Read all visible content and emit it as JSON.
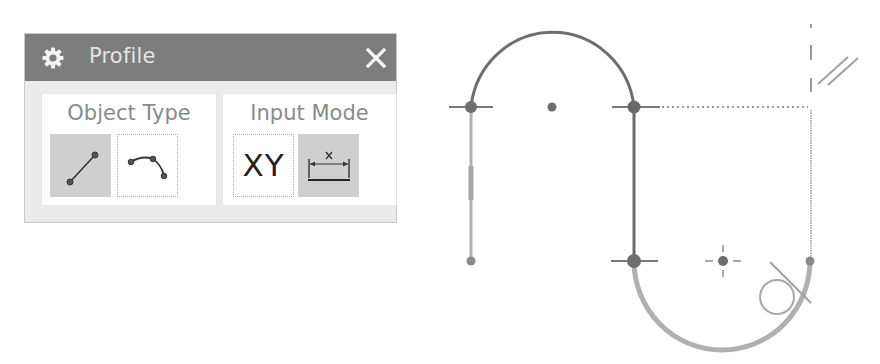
{
  "dialog": {
    "title": "Profile",
    "title_icon": "gear-icon",
    "close_icon": "close-icon",
    "colors": {
      "titlebar": "#7d7d7d",
      "body": "#ebebeb",
      "active_button": "#cfcfcf",
      "label": "#8a8a8a"
    },
    "groups": [
      {
        "label": "Object Type",
        "buttons": [
          {
            "name": "line",
            "icon": "line-icon",
            "active": true
          },
          {
            "name": "arc",
            "icon": "arc-icon",
            "active": false
          }
        ]
      },
      {
        "label": "Input Mode",
        "buttons": [
          {
            "name": "coordinate-mode",
            "label": "XY",
            "active": false
          },
          {
            "name": "parameter-mode",
            "icon": "dimension-icon",
            "active": true
          }
        ]
      }
    ]
  },
  "sketch": {
    "colors": {
      "dark_curve": "#6e6e6e",
      "light_curve": "#b0b0b0",
      "point": "#707070",
      "guide": "#9a9a9a"
    },
    "elements": [
      {
        "type": "arc",
        "name": "top-arc",
        "center": [
          552,
          107
        ],
        "radius": 82
      },
      {
        "type": "line",
        "name": "left-vertical-line",
        "from": [
          471,
          107
        ],
        "to": [
          471,
          261
        ]
      },
      {
        "type": "line",
        "name": "middle-vertical-line",
        "from": [
          634,
          107
        ],
        "to": [
          634,
          261
        ]
      },
      {
        "type": "arc",
        "name": "bottom-arc-preview",
        "center": [
          723,
          261
        ],
        "radius": 88
      },
      {
        "type": "dotted-guide",
        "name": "horizontal-guide",
        "from": [
          660,
          107
        ],
        "to": [
          810,
          107
        ]
      },
      {
        "type": "guide",
        "name": "right-vertical-guide",
        "from": [
          811,
          107
        ],
        "to": [
          811,
          261
        ]
      },
      {
        "type": "dashed-guide",
        "name": "vertical-dashed-guide",
        "from": [
          811,
          24
        ],
        "to": [
          811,
          92
        ]
      },
      {
        "type": "constraint",
        "name": "parallel-symbol",
        "position": [
          838,
          70
        ]
      },
      {
        "type": "constraint",
        "name": "tangent-symbol",
        "position": [
          777,
          297
        ]
      }
    ],
    "points": [
      {
        "name": "left-top-endpoint",
        "position": [
          471,
          107
        ]
      },
      {
        "name": "top-arc-center",
        "position": [
          552,
          107
        ]
      },
      {
        "name": "right-top-endpoint",
        "position": [
          634,
          107
        ]
      },
      {
        "name": "left-bottom-endpoint",
        "position": [
          471,
          261
        ]
      },
      {
        "name": "middle-bottom-endpoint",
        "position": [
          634,
          261
        ]
      },
      {
        "name": "bottom-arc-center",
        "position": [
          723,
          261
        ]
      },
      {
        "name": "cursor-endpoint",
        "position": [
          810,
          261
        ]
      }
    ]
  }
}
